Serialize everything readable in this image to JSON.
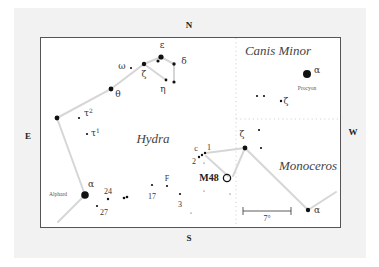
{
  "compass": {
    "north": "N",
    "south": "S",
    "east": "E",
    "west": "W"
  },
  "constellations": [
    {
      "id": "hydra",
      "label": "Hydra"
    },
    {
      "id": "canis-minor",
      "label": "Canis Minor"
    },
    {
      "id": "monoceros",
      "label": "Monoceros"
    }
  ],
  "deep_sky": {
    "label": "M48",
    "type": "open cluster"
  },
  "scale_bar": {
    "label": "7°"
  },
  "named_stars": {
    "alphard": "Alphard",
    "procyon": "Procyon"
  },
  "star_labels": {
    "hydra_epsilon": "ε",
    "hydra_delta": "δ",
    "hydra_zeta": "ζ",
    "hydra_eta": "η",
    "hydra_omega": "ω",
    "hydra_theta": "θ",
    "hydra_tau2": "τ2",
    "hydra_tau1": "τ1",
    "hydra_alpha": "α",
    "hydra_24": "24",
    "hydra_27": "27",
    "hydra_17": "17",
    "hydra_F": "F",
    "hydra_3": "3",
    "hydra_c": "c",
    "hydra_1": "1",
    "hydra_2": "2",
    "cmi_alpha": "α",
    "cmi_zeta": "ζ",
    "mon_zeta": "ζ",
    "mon_alpha": "α"
  },
  "colors": {
    "background": "#f2f2f2",
    "panel": "#ffffff",
    "frame": "#555555",
    "stick_lines": "#d6d6d6",
    "stars": "#111111"
  }
}
